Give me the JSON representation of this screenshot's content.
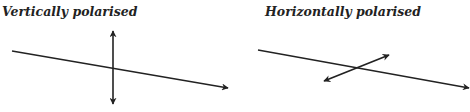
{
  "panels": [
    {
      "title": "Vertically polarised",
      "polarisation": "vertical"
    },
    {
      "title": "Horizontally polarised",
      "polarisation": "horizontal"
    }
  ],
  "colors": {
    "line": "#222222",
    "text": "#222222",
    "background": "#ffffff"
  }
}
